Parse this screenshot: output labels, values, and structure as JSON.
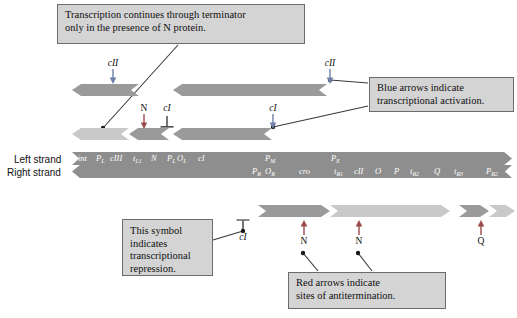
{
  "figure": {
    "colors": {
      "callout_fill": "#d4d4d4",
      "callout_border": "#6b6b6b",
      "strand_gray": "#8e8e8e",
      "blue_arrow": "#6f7fa8",
      "red_arrow": "#9a4a4a",
      "transcript_dark": "#9a9a9a",
      "transcript_light": "#c9c9c9",
      "leader_line": "#3a3a3a",
      "text": "#101010"
    }
  },
  "callouts": {
    "terminator": {
      "line1": "Transcription continues through terminator",
      "line2": "only in the presence of N protein."
    },
    "blue_arrows": {
      "line1": "Blue arrows indicate",
      "line2": "transcriptional  activation."
    },
    "repression": {
      "line1": "This symbol",
      "line2": "indicates",
      "line3": "transcriptional",
      "line4": "repression."
    },
    "red_arrows": {
      "line1": "Red arrows indicate",
      "line2": "sites of antitermination."
    }
  },
  "strands": {
    "left_label": "Left strand",
    "right_label": "Right strand",
    "left_genes": [
      {
        "text": "int",
        "sub": "",
        "x": 6
      },
      {
        "text": "P",
        "sub": "L",
        "x": 24
      },
      {
        "text": "cIII",
        "sub": "",
        "x": 38
      },
      {
        "text": "t",
        "sub": "L1",
        "x": 61
      },
      {
        "text": "N",
        "sub": "",
        "x": 79
      },
      {
        "text": "P",
        "sub": "L",
        "x": 95
      },
      {
        "text": "O",
        "sub": "L",
        "x": 105
      },
      {
        "text": "cI",
        "sub": "",
        "x": 126
      },
      {
        "text": "P",
        "sub": "M",
        "x": 193
      },
      {
        "text": "P",
        "sub": "E",
        "x": 259
      }
    ],
    "right_genes": [
      {
        "text": "P",
        "sub": "R",
        "x": 180
      },
      {
        "text": "O",
        "sub": "R",
        "x": 193
      },
      {
        "text": "cro",
        "sub": "",
        "x": 227
      },
      {
        "text": "t",
        "sub": "R1",
        "x": 262
      },
      {
        "text": "cII",
        "sub": "",
        "x": 282
      },
      {
        "text": "O",
        "sub": "",
        "x": 303
      },
      {
        "text": "P",
        "sub": "",
        "x": 322
      },
      {
        "text": "t",
        "sub": "R2",
        "x": 338
      },
      {
        "text": "Q",
        "sub": "",
        "x": 362
      },
      {
        "text": "t",
        "sub": "R3",
        "x": 382
      },
      {
        "text": "P",
        "sub": "R2",
        "x": 414
      },
      {
        "text": "t",
        "sub": "R4",
        "x": 438
      },
      {
        "text": "S",
        "sub": "",
        "x": 461
      }
    ]
  },
  "annotations": {
    "upper": [
      {
        "id": "cII-left-upper",
        "label": "cII",
        "kind": "blue-down"
      },
      {
        "id": "cII-right-upper",
        "label": "cII",
        "kind": "blue-down"
      },
      {
        "id": "N-upper",
        "label": "N",
        "kind": "red-down"
      },
      {
        "id": "cI-repressor",
        "label": "cI",
        "kind": "t-symbol"
      },
      {
        "id": "cI-right-upper",
        "label": "cI",
        "kind": "blue-down"
      }
    ],
    "lower": [
      {
        "id": "cI-repressor-lower",
        "label": "cI",
        "kind": "t-symbol"
      },
      {
        "id": "N-lower-1",
        "label": "N",
        "kind": "red-up"
      },
      {
        "id": "N-lower-2",
        "label": "N",
        "kind": "red-up"
      },
      {
        "id": "Q-lower",
        "label": "Q",
        "kind": "red-up"
      }
    ]
  }
}
